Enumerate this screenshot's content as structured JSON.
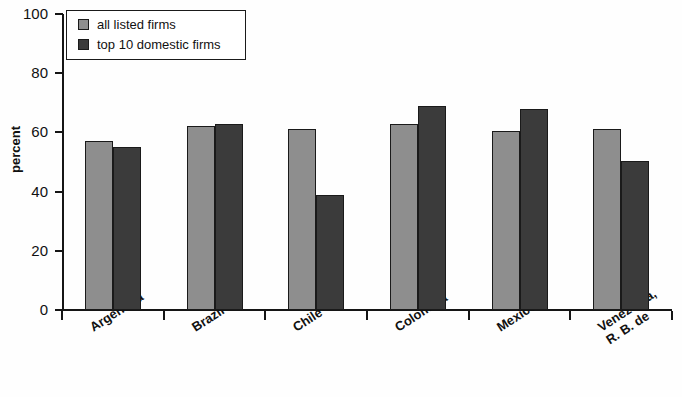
{
  "chart_data": {
    "type": "bar",
    "title": "",
    "subtitle": "",
    "xlabel": "",
    "ylabel": "percent",
    "ylim": [
      0,
      100
    ],
    "ytick_labels": [
      "0",
      "20",
      "40",
      "60",
      "80",
      "100"
    ],
    "ytick_values": [
      0,
      20,
      40,
      60,
      80,
      100
    ],
    "grid": false,
    "legend_position": "top-left",
    "categories": [
      "Argentina",
      "Brazil",
      "Chile",
      "Colombia",
      "Mexico",
      "Venezuela,\nR. B. de"
    ],
    "series": [
      {
        "name": "all listed firms",
        "color": "#8e8e8e",
        "values": [
          57,
          62,
          61,
          63,
          60.5,
          61
        ]
      },
      {
        "name": "top 10 domestic firms",
        "color": "#3b3b3b",
        "values": [
          55,
          63,
          39,
          69,
          68,
          50.5
        ]
      }
    ]
  },
  "legend": {
    "items": [
      {
        "label": "all listed firms",
        "swatch": "light"
      },
      {
        "label": "top 10 domestic firms",
        "swatch": "dark"
      }
    ]
  },
  "axes": {
    "y_title": "percent",
    "y_ticks": [
      "100",
      "80",
      "60",
      "40",
      "20",
      "0"
    ],
    "x_categories": [
      {
        "line1": "Argentina",
        "line2": ""
      },
      {
        "line1": "Brazil",
        "line2": ""
      },
      {
        "line1": "Chile",
        "line2": ""
      },
      {
        "line1": "Colombia",
        "line2": ""
      },
      {
        "line1": "Mexico",
        "line2": ""
      },
      {
        "line1": "Venezuela,",
        "line2": "R. B. de"
      }
    ]
  },
  "colors": {
    "series_light": "#8e8e8e",
    "series_dark": "#3b3b3b",
    "axis": "#151515",
    "background": "#fefefe"
  }
}
